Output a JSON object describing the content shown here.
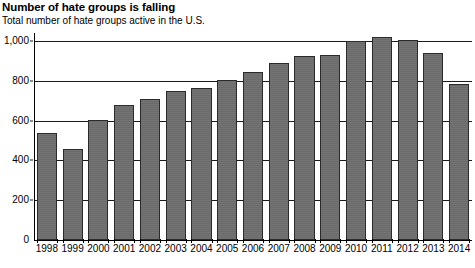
{
  "title": "Number of hate groups is falling",
  "subtitle": "Total number of hate groups active in the U.S.",
  "colors": {
    "bar_fill": "#6e6e6e",
    "bar_border": "#2b2b2b",
    "gridline": "#1a1a1a",
    "axis": "#000000",
    "background": "#ffffff",
    "text": "#000000"
  },
  "chart_data": {
    "type": "bar",
    "title": "Number of hate groups is falling",
    "subtitle": "Total number of hate groups active in the U.S.",
    "xlabel": "",
    "ylabel": "",
    "ylim": [
      0,
      1040
    ],
    "grid": true,
    "legend": false,
    "categories": [
      "1998",
      "1999",
      "2000",
      "2001",
      "2002",
      "2003",
      "2004",
      "2005",
      "2006",
      "2007",
      "2008",
      "2009",
      "2010",
      "2011",
      "2012",
      "2013",
      "2014"
    ],
    "values": [
      537,
      457,
      602,
      676,
      708,
      751,
      762,
      803,
      844,
      888,
      926,
      932,
      1002,
      1018,
      1007,
      939,
      784
    ],
    "ytick_values": [
      0,
      200,
      400,
      600,
      800,
      1000
    ],
    "ytick_labels": [
      "0",
      "200",
      "400",
      "600",
      "800",
      "1,000"
    ]
  }
}
